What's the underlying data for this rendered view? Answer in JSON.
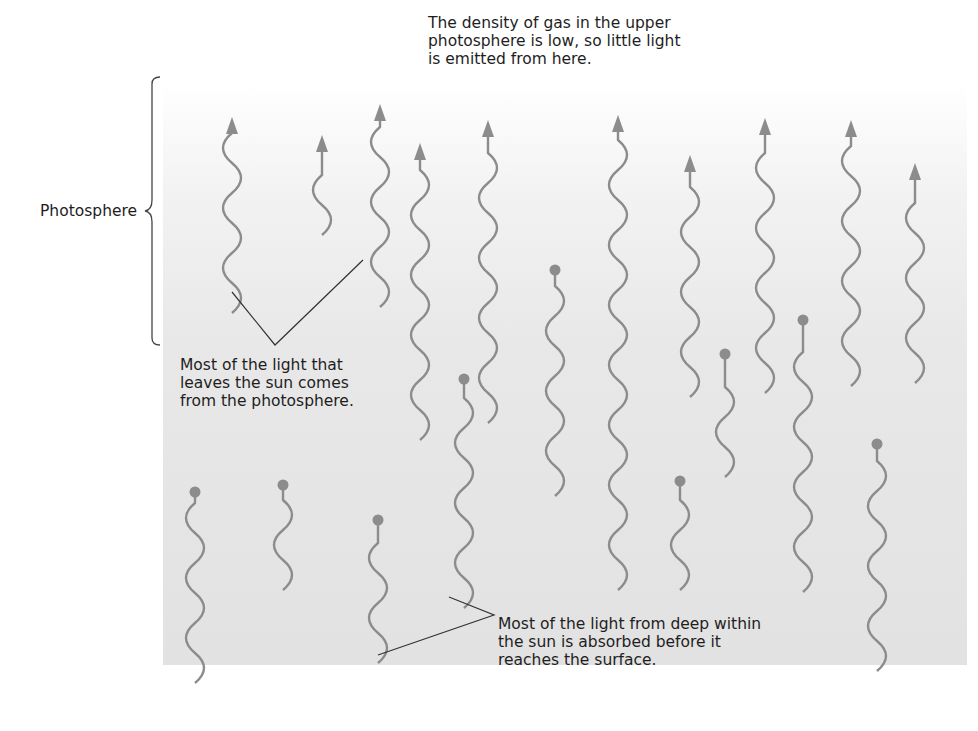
{
  "diagram": {
    "labels": {
      "photosphere": "Photosphere",
      "top_note": "The density of gas in the upper\nphotosphere is low, so little light\nis emitted from here.",
      "middle_note": "Most of the light that\nleaves the sun comes\nfrom the photosphere.",
      "bottom_note": "Most of the light from deep within\nthe sun is absorbed before it\nreaches the surface."
    },
    "colors": {
      "wave": "#8c8c8c",
      "text": "#1e1e1e",
      "leader_line": "#333333",
      "panel_top": "#ffffff",
      "panel_bottom": "#e2e2e2"
    },
    "escaping_waves": [
      {
        "x": 232,
        "top": 117,
        "bottom": 313
      },
      {
        "x": 322,
        "top": 135,
        "bottom": 235
      },
      {
        "x": 380,
        "top": 104,
        "bottom": 307
      },
      {
        "x": 420,
        "top": 143,
        "bottom": 440
      },
      {
        "x": 488,
        "top": 120,
        "bottom": 423
      },
      {
        "x": 618,
        "top": 115,
        "bottom": 590
      },
      {
        "x": 690,
        "top": 155,
        "bottom": 397
      },
      {
        "x": 765,
        "top": 118,
        "bottom": 393
      },
      {
        "x": 851,
        "top": 120,
        "bottom": 386
      },
      {
        "x": 915,
        "top": 163,
        "bottom": 383
      }
    ],
    "absorbed_waves": [
      {
        "x": 195,
        "dot": 492,
        "bottom": 683
      },
      {
        "x": 283,
        "dot": 485,
        "bottom": 590
      },
      {
        "x": 378,
        "dot": 520,
        "bottom": 663
      },
      {
        "x": 464,
        "dot": 379,
        "bottom": 608
      },
      {
        "x": 555,
        "dot": 270,
        "bottom": 496
      },
      {
        "x": 680,
        "dot": 481,
        "bottom": 590
      },
      {
        "x": 725,
        "dot": 354,
        "bottom": 477
      },
      {
        "x": 803,
        "dot": 320,
        "bottom": 592
      },
      {
        "x": 877,
        "dot": 444,
        "bottom": 671
      }
    ]
  }
}
